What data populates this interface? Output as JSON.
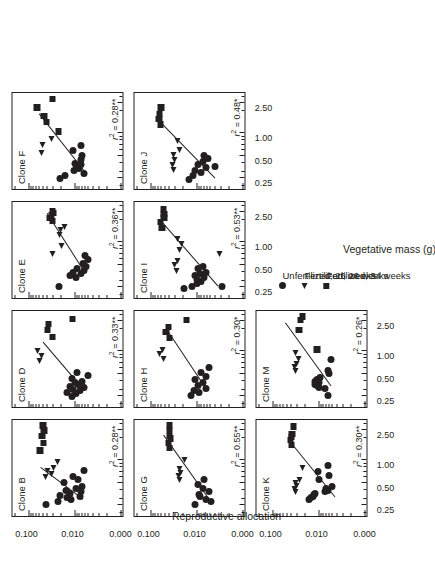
{
  "figure": {
    "x_axis_title": "Vegetative mass (g)",
    "y_axis_title": "Reproductive allocation",
    "x_tick_labels": [
      "0.25",
      "0.50",
      "1.00",
      "2.50"
    ],
    "y_tick_labels": [
      "0.100",
      "0.010",
      "0.000"
    ],
    "marker_color": "#231f20"
  },
  "legend": {
    "items": [
      {
        "symbol": "filled-circle",
        "label": "Unfertilized, 26 weeks"
      },
      {
        "symbol": "filled-triangle",
        "label": "Fertilized, 26 weeks"
      },
      {
        "symbol": "filled-square",
        "label": "Fertilized, 34 weeks"
      }
    ]
  },
  "chart_data": {
    "type": "scatter",
    "title": "",
    "xlabel": "Vegetative mass (g)",
    "ylabel": "Reproductive allocation",
    "x_scale": "log",
    "y_scale": "log",
    "xlim": [
      0.18,
      3.6
    ],
    "ylim": [
      0.0008,
      0.22
    ],
    "x_ticks": [
      0.25,
      0.5,
      1.0,
      2.5
    ],
    "y_ticks": [
      0.1,
      0.01,
      0.0
    ],
    "grid": false,
    "legend_position": "bottom-left",
    "series_definitions": [
      {
        "name": "Unfertilized, 26 weeks",
        "marker": "circle"
      },
      {
        "name": "Fertilized, 26 weeks",
        "marker": "triangle"
      },
      {
        "name": "Fertilized, 34 weeks",
        "marker": "square"
      }
    ],
    "panels": [
      {
        "id": "cloneB",
        "title": "Clone B",
        "r2": "0.28",
        "sig": "**",
        "fit": {
          "x1": 0.3,
          "y1": 0.0065,
          "x2": 0.8,
          "y2": 0.055
        },
        "points": {
          "circle": [
            [
              0.26,
              0.04
            ],
            [
              0.28,
              0.022
            ],
            [
              0.3,
              0.0115
            ],
            [
              0.32,
              0.0145
            ],
            [
              0.33,
              0.0075
            ],
            [
              0.34,
              0.0205
            ],
            [
              0.36,
              0.0125
            ],
            [
              0.38,
              0.0072
            ],
            [
              0.4,
              0.0148
            ],
            [
              0.42,
              0.0092
            ],
            [
              0.45,
              0.0068
            ],
            [
              0.5,
              0.017
            ],
            [
              0.55,
              0.0082
            ],
            [
              0.6,
              0.0108
            ],
            [
              0.72,
              0.0062
            ]
          ],
          "triangle": [
            [
              0.6,
              0.04
            ],
            [
              0.66,
              0.03
            ],
            [
              0.72,
              0.036
            ],
            [
              0.8,
              0.027
            ],
            [
              0.95,
              0.022
            ]
          ],
          "square": [
            [
              1.35,
              0.055
            ],
            [
              1.7,
              0.047
            ],
            [
              2.1,
              0.05
            ],
            [
              2.5,
              0.045
            ],
            [
              2.9,
              0.048
            ]
          ]
        }
      },
      {
        "id": "cloneD",
        "title": "Clone D",
        "r2": "0.33",
        "sig": "**",
        "fit": {
          "x1": 0.3,
          "y1": 0.0062,
          "x2": 1.3,
          "y2": 0.048
        },
        "points": {
          "circle": [
            [
              0.25,
              0.011
            ],
            [
              0.27,
              0.009
            ],
            [
              0.28,
              0.0145
            ],
            [
              0.3,
              0.0075
            ],
            [
              0.31,
              0.0105
            ],
            [
              0.33,
              0.006
            ],
            [
              0.34,
              0.0125
            ],
            [
              0.36,
              0.0082
            ],
            [
              0.38,
              0.0098
            ],
            [
              0.4,
              0.0068
            ],
            [
              0.43,
              0.011
            ],
            [
              0.47,
              0.005
            ],
            [
              0.52,
              0.0085
            ]
          ],
          "triangle": [
            [
              0.75,
              0.055
            ],
            [
              0.88,
              0.05
            ],
            [
              1.0,
              0.06
            ]
          ],
          "square": [
            [
              1.55,
              0.03
            ],
            [
              1.9,
              0.038
            ],
            [
              2.3,
              0.036
            ],
            [
              2.7,
              0.011
            ]
          ]
        }
      },
      {
        "id": "cloneE",
        "title": "Clone E",
        "r2": "0.36",
        "sig": "**",
        "fit": {
          "x1": 0.45,
          "y1": 0.007,
          "x2": 2.4,
          "y2": 0.04
        },
        "points": {
          "circle": [
            [
              0.26,
              0.021
            ],
            [
              0.34,
              0.009
            ],
            [
              0.36,
              0.0125
            ],
            [
              0.38,
              0.0072
            ],
            [
              0.4,
              0.0105
            ],
            [
              0.42,
              0.006
            ],
            [
              0.45,
              0.0088
            ],
            [
              0.48,
              0.0055
            ],
            [
              0.52,
              0.0065
            ],
            [
              0.58,
              0.005
            ],
            [
              0.66,
              0.0058
            ]
          ],
          "triangle": [
            [
              0.7,
              0.028
            ],
            [
              0.9,
              0.018
            ],
            [
              1.25,
              0.02
            ],
            [
              1.45,
              0.019
            ],
            [
              1.6,
              0.016
            ]
          ],
          "square": [
            [
              1.9,
              0.03
            ],
            [
              2.1,
              0.034
            ],
            [
              2.3,
              0.031
            ],
            [
              2.45,
              0.028
            ],
            [
              2.6,
              0.03
            ]
          ]
        }
      },
      {
        "id": "cloneF",
        "title": "Clone F",
        "r2": "0.28",
        "sig": "**",
        "fit": {
          "x1": 0.3,
          "y1": 0.006,
          "x2": 1.8,
          "y2": 0.06
        },
        "points": {
          "circle": [
            [
              0.25,
              0.02
            ],
            [
              0.27,
              0.016
            ],
            [
              0.29,
              0.006
            ],
            [
              0.32,
              0.01
            ],
            [
              0.34,
              0.0078
            ],
            [
              0.36,
              0.0088
            ],
            [
              0.38,
              0.007
            ],
            [
              0.4,
              0.0095
            ],
            [
              0.44,
              0.0072
            ],
            [
              0.5,
              0.0068
            ],
            [
              0.58,
              0.0105
            ],
            [
              0.68,
              0.0072
            ]
          ],
          "triangle": [
            [
              0.55,
              0.05
            ],
            [
              0.7,
              0.048
            ],
            [
              0.85,
              0.03
            ]
          ],
          "square": [
            [
              1.05,
              0.022
            ],
            [
              1.4,
              0.04
            ],
            [
              1.7,
              0.045
            ],
            [
              2.2,
              0.065
            ],
            [
              2.85,
              0.03
            ]
          ]
        }
      },
      {
        "id": "cloneG",
        "title": "Clone G",
        "r2": "0.55",
        "sig": "**",
        "fit": {
          "x1": 0.28,
          "y1": 0.0048,
          "x2": 2.2,
          "y2": 0.052
        },
        "points": {
          "circle": [
            [
              0.26,
              0.0105
            ],
            [
              0.28,
              0.0048
            ],
            [
              0.3,
              0.006
            ],
            [
              0.33,
              0.0082
            ],
            [
              0.35,
              0.0085
            ],
            [
              0.38,
              0.0052
            ],
            [
              0.42,
              0.007
            ],
            [
              0.48,
              0.009
            ],
            [
              0.55,
              0.0068
            ]
          ],
          "triangle": [
            [
              0.55,
              0.022
            ],
            [
              0.62,
              0.023
            ],
            [
              0.68,
              0.021
            ],
            [
              0.78,
              0.022
            ],
            [
              1.0,
              0.017
            ]
          ],
          "square": [
            [
              1.45,
              0.038
            ],
            [
              1.7,
              0.04
            ],
            [
              1.95,
              0.036
            ],
            [
              2.1,
              0.038
            ],
            [
              2.55,
              0.038
            ],
            [
              2.95,
              0.038
            ]
          ]
        }
      },
      {
        "id": "cloneH",
        "title": "Clone H",
        "r2": "0.30",
        "sig": "*",
        "fit": {
          "x1": 0.3,
          "y1": 0.006,
          "x2": 2.0,
          "y2": 0.047
        },
        "points": {
          "circle": [
            [
              0.26,
              0.013
            ],
            [
              0.28,
              0.0088
            ],
            [
              0.3,
              0.011
            ],
            [
              0.32,
              0.006
            ],
            [
              0.35,
              0.0092
            ],
            [
              0.38,
              0.007
            ],
            [
              0.42,
              0.0105
            ],
            [
              0.46,
              0.0062
            ],
            [
              0.52,
              0.008
            ],
            [
              0.6,
              0.0052
            ]
          ],
          "triangle": [
            [
              0.8,
              0.05
            ],
            [
              0.92,
              0.06
            ],
            [
              1.05,
              0.052
            ]
          ],
          "square": [
            [
              1.5,
              0.038
            ],
            [
              1.8,
              0.045
            ],
            [
              2.1,
              0.04
            ],
            [
              2.6,
              0.016
            ]
          ]
        }
      },
      {
        "id": "cloneI",
        "title": "Clone I",
        "r2": "0.53",
        "sig": "**",
        "fit": {
          "x1": 0.26,
          "y1": 0.0035,
          "x2": 1.9,
          "y2": 0.06
        },
        "points": {
          "circle": [
            [
              0.24,
              0.018
            ],
            [
              0.26,
              0.0125
            ],
            [
              0.28,
              0.0095
            ],
            [
              0.3,
              0.0078
            ],
            [
              0.32,
              0.0098
            ],
            [
              0.34,
              0.0068
            ],
            [
              0.36,
              0.0105
            ],
            [
              0.38,
              0.0082
            ],
            [
              0.4,
              0.006
            ],
            [
              0.44,
              0.009
            ],
            [
              0.48,
              0.007
            ],
            [
              0.26,
              0.0028
            ]
          ],
          "triangle": [
            [
              0.42,
              0.026
            ],
            [
              0.5,
              0.028
            ],
            [
              0.56,
              0.024
            ],
            [
              0.8,
              0.022
            ],
            [
              0.95,
              0.02
            ],
            [
              1.1,
              0.024
            ],
            [
              0.7,
              0.003
            ]
          ],
          "square": [
            [
              1.55,
              0.055
            ],
            [
              1.85,
              0.06
            ],
            [
              2.1,
              0.05
            ],
            [
              2.4,
              0.05
            ],
            [
              2.75,
              0.052
            ]
          ]
        }
      },
      {
        "id": "cloneJ",
        "title": "Clone J",
        "r2": "0.48",
        "sig": "*",
        "fit": {
          "x1": 0.25,
          "y1": 0.004,
          "x2": 1.5,
          "y2": 0.07
        },
        "points": {
          "circle": [
            [
              0.24,
              0.0145
            ],
            [
              0.27,
              0.0115
            ],
            [
              0.3,
              0.008
            ],
            [
              0.32,
              0.0105
            ],
            [
              0.35,
              0.0062
            ],
            [
              0.38,
              0.009
            ],
            [
              0.42,
              0.0072
            ],
            [
              0.46,
              0.0055
            ],
            [
              0.36,
              0.0038
            ],
            [
              0.5,
              0.0068
            ]
          ],
          "triangle": [
            [
              0.33,
              0.03
            ],
            [
              0.38,
              0.032
            ],
            [
              0.44,
              0.028
            ],
            [
              0.52,
              0.03
            ],
            [
              0.6,
              0.022
            ],
            [
              0.8,
              0.024
            ]
          ],
          "square": [
            [
              1.3,
              0.06
            ],
            [
              1.55,
              0.065
            ],
            [
              1.8,
              0.062
            ],
            [
              2.2,
              0.058
            ]
          ]
        }
      },
      {
        "id": "cloneK",
        "title": "Clone K",
        "r2": "0.30",
        "sig": "**",
        "fit": {
          "x1": 0.32,
          "y1": 0.0045,
          "x2": 1.6,
          "y2": 0.038
        },
        "points": {
          "circle": [
            [
              0.3,
              0.0155
            ],
            [
              0.32,
              0.014
            ],
            [
              0.33,
              0.013
            ],
            [
              0.35,
              0.0125
            ],
            [
              0.36,
              0.0115
            ],
            [
              0.38,
              0.0072
            ],
            [
              0.4,
              0.006
            ],
            [
              0.42,
              0.0068
            ],
            [
              0.45,
              0.005
            ],
            [
              0.55,
              0.0095
            ],
            [
              0.7,
              0.01
            ],
            [
              0.62,
              0.0058
            ],
            [
              0.85,
              0.0062
            ]
          ],
          "triangle": [
            [
              0.38,
              0.03
            ],
            [
              0.42,
              0.032
            ],
            [
              0.46,
              0.028
            ],
            [
              0.5,
              0.03
            ],
            [
              0.55,
              0.024
            ],
            [
              0.8,
              0.021
            ]
          ],
          "square": [
            [
              1.6,
              0.038
            ],
            [
              1.85,
              0.04
            ],
            [
              2.05,
              0.038
            ],
            [
              2.25,
              0.037
            ],
            [
              2.8,
              0.034
            ]
          ]
        }
      },
      {
        "id": "cloneM",
        "title": "Clone M",
        "r2": "0.26",
        "sig": "*",
        "fit": {
          "x1": 0.34,
          "y1": 0.0055,
          "x2": 2.4,
          "y2": 0.055
        },
        "points": {
          "circle": [
            [
              0.26,
              0.0062
            ],
            [
              0.32,
              0.007
            ],
            [
              0.33,
              0.0095
            ],
            [
              0.35,
              0.0105
            ],
            [
              0.36,
              0.0115
            ],
            [
              0.38,
              0.0098
            ],
            [
              0.4,
              0.012
            ],
            [
              0.42,
              0.0105
            ],
            [
              0.44,
              0.009
            ],
            [
              0.5,
              0.0058
            ],
            [
              0.55,
              0.006
            ],
            [
              0.78,
              0.0052
            ]
          ],
          "triangle": [
            [
              0.55,
              0.03
            ],
            [
              0.62,
              0.031
            ],
            [
              0.68,
              0.029
            ],
            [
              0.8,
              0.026
            ],
            [
              0.95,
              0.03
            ]
          ],
          "square": [
            [
              1.05,
              0.0105
            ],
            [
              1.9,
              0.026
            ],
            [
              2.6,
              0.024
            ],
            [
              2.9,
              0.022
            ]
          ]
        }
      }
    ]
  }
}
